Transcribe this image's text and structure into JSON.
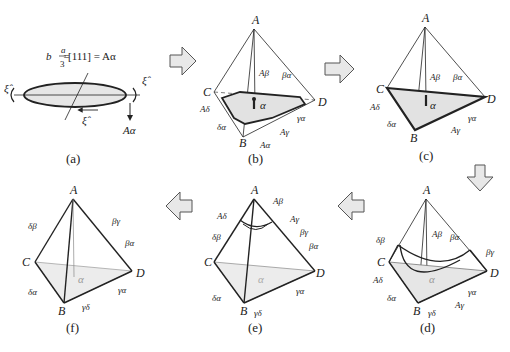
{
  "figure": {
    "panels": [
      {
        "id": "a",
        "caption": "(a)",
        "equation": {
          "lhs": "b⃗ =",
          "frac_num": "a",
          "frac_den": "3",
          "rhs": "[111] = Aα"
        },
        "labels": {
          "xi_left": "ξ̂",
          "xi_right": "ξ̂",
          "xi_bottom": "ξ̂",
          "burgers": "Aα"
        }
      },
      {
        "id": "b",
        "caption": "(b)",
        "vertices": {
          "A": "A",
          "B": "B",
          "C": "C",
          "D": "D"
        },
        "labels": [
          "Aβ",
          "βα",
          "Aδ",
          "δα",
          "Aα",
          "Aγ",
          "γα"
        ],
        "center": "α"
      },
      {
        "id": "c",
        "caption": "(c)",
        "vertices": {
          "A": "A",
          "B": "B",
          "C": "C",
          "D": "D"
        },
        "labels": [
          "Aβ",
          "βα",
          "Aδ",
          "δα",
          "Aγ",
          "γα"
        ],
        "center": "α"
      },
      {
        "id": "d",
        "caption": "(d)",
        "vertices": {
          "A": "A",
          "B": "B",
          "C": "C",
          "D": "D"
        },
        "labels": [
          "δβ",
          "Aβ",
          "βα",
          "βγ",
          "Aδ",
          "δα",
          "γδ",
          "Aγ",
          "γα"
        ],
        "center": "α"
      },
      {
        "id": "e",
        "caption": "(e)",
        "vertices": {
          "A": "A",
          "B": "B",
          "C": "C",
          "D": "D"
        },
        "labels": [
          "Aβ",
          "Aδ",
          "Aγ",
          "δβ",
          "βγ",
          "βα",
          "δα",
          "γδ",
          "γα"
        ],
        "center": "α"
      },
      {
        "id": "f",
        "caption": "(f)",
        "vertices": {
          "A": "A",
          "B": "B",
          "C": "C",
          "D": "D"
        },
        "labels": [
          "δβ",
          "βγ",
          "βα",
          "δα",
          "γδ",
          "γα"
        ],
        "center": "α"
      }
    ],
    "arrows": [
      "a-to-b",
      "b-to-c",
      "c-to-d",
      "d-to-e",
      "e-to-f"
    ]
  }
}
